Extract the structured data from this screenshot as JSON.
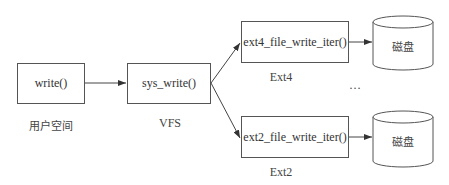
{
  "diagram": {
    "nodes": [
      {
        "id": "write",
        "label": "write()",
        "caption": "用户空间"
      },
      {
        "id": "sys_write",
        "label": "sys_write()",
        "caption": "VFS"
      },
      {
        "id": "ext4",
        "label": "ext4_file_write_iter()",
        "caption": "Ext4"
      },
      {
        "id": "ext2",
        "label": "ext2_file_write_iter()",
        "caption": "Ext2"
      },
      {
        "id": "disk1",
        "label": "磁盘",
        "shape": "cylinder"
      },
      {
        "id": "disk2",
        "label": "磁盘",
        "shape": "cylinder"
      }
    ],
    "edges": [
      {
        "from": "write",
        "to": "sys_write"
      },
      {
        "from": "sys_write",
        "to": "ext4"
      },
      {
        "from": "sys_write",
        "to": "ext2"
      },
      {
        "from": "ext4",
        "to": "disk1"
      },
      {
        "from": "ext2",
        "to": "disk2"
      }
    ],
    "ellipsis": "…",
    "colors": {
      "stroke": "#555555",
      "text": "#333333",
      "background": "#ffffff"
    }
  }
}
